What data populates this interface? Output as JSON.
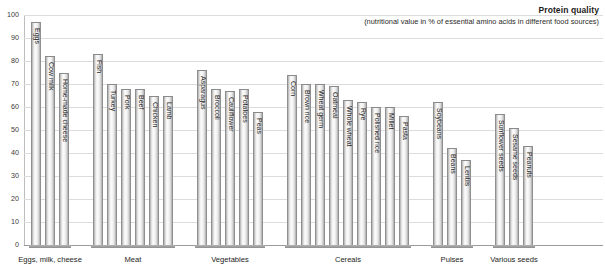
{
  "header": {
    "title": "Protein quality",
    "subtitle": "(nutritional value in % of essential amino acids in different food sources)"
  },
  "chart_data": {
    "type": "bar",
    "title": "Protein quality",
    "subtitle": "(nutritional value in % of essential amino acids in different food sources)",
    "xlabel": "",
    "ylabel": "",
    "ylim": [
      0,
      100
    ],
    "yticks": [
      0,
      10,
      20,
      30,
      40,
      50,
      60,
      70,
      80,
      90,
      100
    ],
    "grid": true,
    "legend": "none",
    "orientation": "vertical",
    "groups": [
      {
        "name": "Eggs, milk, cheese",
        "categories": [
          "Eggs",
          "Cow milk",
          "Home-made cheese"
        ],
        "values": [
          97,
          82,
          75
        ]
      },
      {
        "name": "Meat",
        "categories": [
          "Fish",
          "Turkey",
          "Pork",
          "Beef",
          "Chicken",
          "Lamb"
        ],
        "values": [
          83,
          70,
          68,
          68,
          65,
          65
        ]
      },
      {
        "name": "Vegetables",
        "categories": [
          "Asparagus",
          "Broccoli",
          "Cauliflower",
          "Potatoes",
          "Peas"
        ],
        "values": [
          76,
          68,
          67,
          68,
          58
        ]
      },
      {
        "name": "Cereals",
        "categories": [
          "Corn",
          "Brown rice",
          "Wheat germ",
          "Oatmeal",
          "Whole wheat",
          "Rye",
          "Polished rice",
          "Millet",
          "Pasta"
        ],
        "values": [
          74,
          70,
          70,
          69,
          63,
          62,
          60,
          60,
          56
        ]
      },
      {
        "name": "Pulses",
        "categories": [
          "Soybeans",
          "Beans",
          "Lentils"
        ],
        "values": [
          62,
          42,
          37
        ]
      },
      {
        "name": "Various seeds",
        "categories": [
          "Sunflower seeds",
          "Sesame seeds",
          "Peanuts"
        ],
        "values": [
          57,
          51,
          43
        ]
      }
    ]
  }
}
